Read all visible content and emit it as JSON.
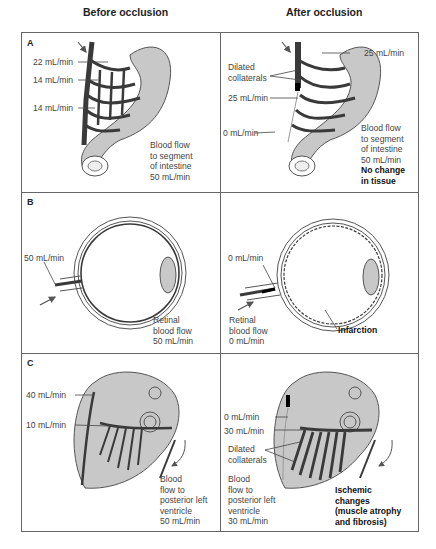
{
  "headers": {
    "before": "Before occlusion",
    "after": "After occlusion"
  },
  "panels": {
    "A": {
      "label": "A",
      "before": {
        "flow_labels": [
          "22 mL/min",
          "14 mL/min",
          "14 mL/min"
        ],
        "caption": "Blood flow\nto segment\nof intestine\n50 mL/min"
      },
      "after": {
        "top_flow": "25 mL/min",
        "collaterals": "Dilated\ncollaterals",
        "mid_flow": "25 mL/min",
        "low_flow": "0 mL/min",
        "caption": "Blood flow\nto segment\nof intestine\n50 mL/min",
        "outcome": "No change\nin tissue"
      }
    },
    "B": {
      "label": "B",
      "before": {
        "flow": "50 mL/min",
        "caption": "Retinal\nblood flow\n50 mL/min"
      },
      "after": {
        "flow": "0 mL/min",
        "caption": "Retinal\nblood flow\n0 mL/min",
        "outcome": "Infarction"
      }
    },
    "C": {
      "label": "C",
      "before": {
        "flow_labels": [
          "40 mL/min",
          "10 mL/min"
        ],
        "caption": "Blood\nflow to\nposterior left\nventricle\n50 mL/min"
      },
      "after": {
        "flow_labels": [
          "0 mL/min",
          "30 mL/min"
        ],
        "collaterals": "Dilated\ncollaterals",
        "caption": "Blood\nflow to\nposterior left\nventricle\n30 mL/min",
        "outcome": "Ischemic\nchanges\n(muscle atrophy\nand fibrosis)"
      }
    }
  },
  "colors": {
    "organ": "#c8c8c8",
    "vessel": "#3a3a3a",
    "outline": "#555555",
    "border": "#666666"
  }
}
